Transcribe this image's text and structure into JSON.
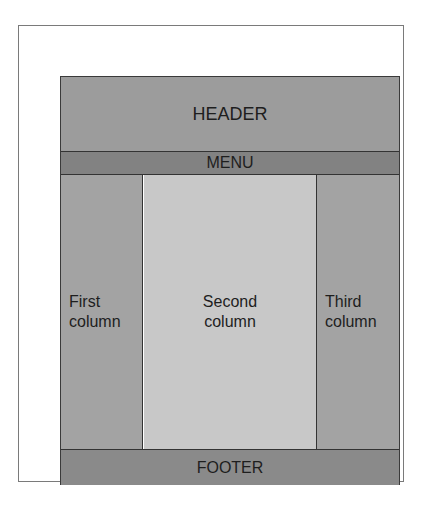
{
  "diagram": {
    "header": "HEADER",
    "menu": "MENU",
    "columns": [
      {
        "label": "First\ncolumn"
      },
      {
        "label": "Second\ncolumn"
      },
      {
        "label": "Third\ncolumn"
      }
    ],
    "footer": "FOOTER"
  },
  "colors": {
    "header": "#9c9c9c",
    "menu": "#828282",
    "side_columns": "#a3a3a3",
    "center_column": "#c8c8c8",
    "footer": "#8a8a8a"
  }
}
